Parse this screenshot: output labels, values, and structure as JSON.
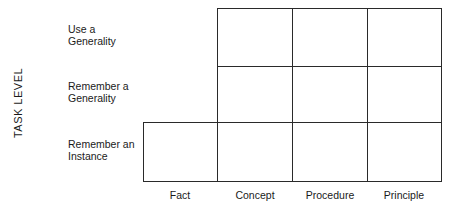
{
  "diagram": {
    "y_axis_title": "TASK LEVEL",
    "rows": [
      {
        "line1": "Use a",
        "line2": "Generality"
      },
      {
        "line1": "Remember a",
        "line2": "Generality"
      },
      {
        "line1": "Remember an",
        "line2": "Instance"
      }
    ],
    "columns": [
      "Fact",
      "Concept",
      "Procedure",
      "Principle"
    ],
    "matrix_cells_present": [
      [
        false,
        true,
        true,
        true
      ],
      [
        false,
        true,
        true,
        true
      ],
      [
        true,
        true,
        true,
        true
      ]
    ]
  }
}
